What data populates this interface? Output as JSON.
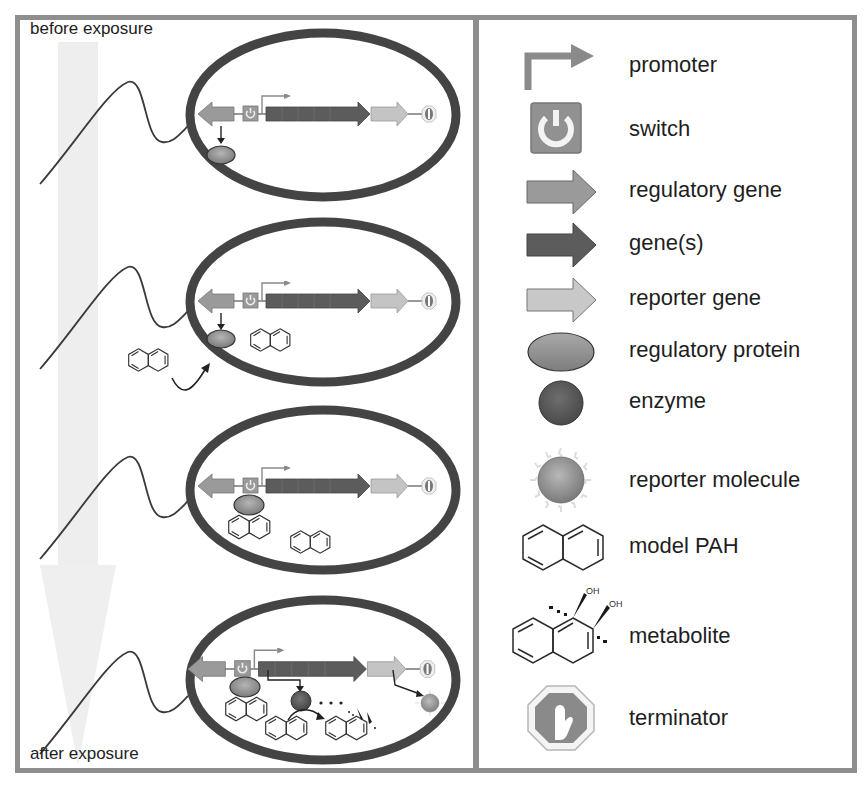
{
  "figure": {
    "left_panel": {
      "top_label": "before exposure",
      "bottom_label": "after exposure",
      "stages": [
        {
          "name": "stage-1",
          "description": "regulatory protein expressed, switch off"
        },
        {
          "name": "stage-2",
          "description": "model PAH enters cell"
        },
        {
          "name": "stage-3",
          "description": "PAH binds regulatory protein at switch"
        },
        {
          "name": "stage-4",
          "description": "genes expressed: enzyme converts PAH to metabolite, reporter molecule produced"
        }
      ]
    },
    "legend": {
      "items": [
        {
          "icon": "promoter-icon",
          "label": "promoter"
        },
        {
          "icon": "switch-icon",
          "label": "switch"
        },
        {
          "icon": "regulatory-gene-icon",
          "label": "regulatory gene"
        },
        {
          "icon": "genes-icon",
          "label": "gene(s)"
        },
        {
          "icon": "reporter-gene-icon",
          "label": "reporter gene"
        },
        {
          "icon": "regulatory-protein-icon",
          "label": "regulatory protein"
        },
        {
          "icon": "enzyme-icon",
          "label": "enzyme"
        },
        {
          "icon": "reporter-molecule-icon",
          "label": "reporter molecule"
        },
        {
          "icon": "model-pah-icon",
          "label": "model PAH"
        },
        {
          "icon": "metabolite-icon",
          "label": "metabolite"
        },
        {
          "icon": "terminator-icon",
          "label": "terminator"
        }
      ],
      "metabolite_oh_labels": [
        "OH",
        "OH"
      ]
    },
    "colors": {
      "frame": "#8e8e8e",
      "cell_wall": "#444444",
      "promoter": "#8a8a8a",
      "switch_fill": "#8f8f8f",
      "regulatory_gene": "#9a9a9a",
      "genes": "#5c5c5c",
      "reporter_gene": "#c4c4c4",
      "regulatory_protein": "#8c8c8c",
      "enzyme": "#5a5a5a",
      "reporter_molecule": "#9a9a9a",
      "fade_arrow": "#ececec"
    }
  }
}
